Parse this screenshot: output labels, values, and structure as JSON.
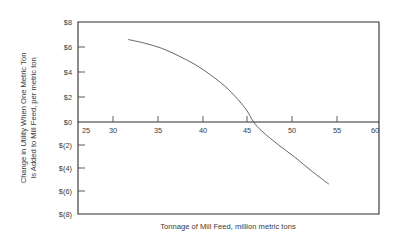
{
  "chart_data": {
    "type": "line",
    "title": "",
    "subtitle": "",
    "xlabel": "Tonnage of Mill Feed, million metric tons",
    "ylabel_line1": "Change in Utility When One Metric Ton",
    "ylabel_line2": "Is Added to Mill Feed, per metric ton",
    "xlim": [
      24,
      60
    ],
    "ylim": [
      -8,
      8
    ],
    "grid": false,
    "legend": "none",
    "x_ticks": [
      25,
      30,
      35,
      40,
      45,
      50,
      55,
      60
    ],
    "x_tick_labels": [
      "25",
      "30",
      "35",
      "40",
      "45",
      "50",
      "55",
      "60"
    ],
    "y_ticks": [
      8,
      6,
      4,
      2,
      0,
      -2,
      -4,
      -6,
      -8
    ],
    "y_tick_labels": [
      "$8",
      "$6",
      "$4",
      "$2",
      "$0",
      "$(2)",
      "$(4)",
      "$(6)",
      "$(8)"
    ],
    "zero_reference_line": 0,
    "series": [
      {
        "name": "Change in utility",
        "x": [
          30,
          32,
          34,
          36,
          38,
          40,
          42,
          44,
          45,
          46,
          48,
          50,
          52,
          54
        ],
        "values": [
          6.6,
          6.3,
          5.9,
          5.3,
          4.6,
          3.7,
          2.6,
          1.1,
          0.0,
          -0.8,
          -2.0,
          -3.1,
          -4.3,
          -5.4
        ]
      }
    ],
    "annotations": []
  }
}
